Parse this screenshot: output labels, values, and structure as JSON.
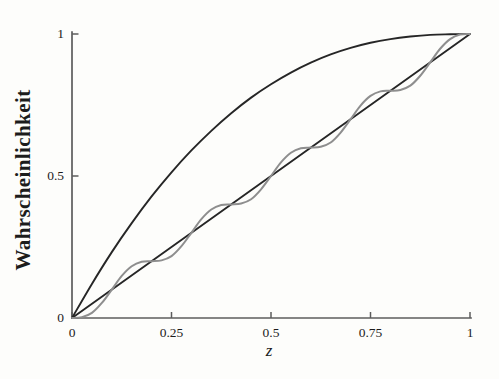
{
  "figure": {
    "background": "#fdfdfb",
    "axis_color": "#5c5c5c",
    "text_color": "#1c1c1c",
    "curve_black": "#262626",
    "curve_gray": "#8e8e8e"
  },
  "chart_data": {
    "type": "line",
    "title": "",
    "xlabel": "z",
    "ylabel": "Wahrscheinlichkeit",
    "xlim": [
      0,
      1
    ],
    "ylim": [
      0,
      1
    ],
    "grid": false,
    "legend": false,
    "x_ticks": [
      {
        "value": 0,
        "label": "0"
      },
      {
        "value": 0.25,
        "label": "0.25"
      },
      {
        "value": 0.5,
        "label": "0.5"
      },
      {
        "value": 0.75,
        "label": "0.75"
      },
      {
        "value": 1,
        "label": "1"
      }
    ],
    "y_ticks": [
      {
        "value": 0,
        "label": "0"
      },
      {
        "value": 0.5,
        "label": "0.5"
      },
      {
        "value": 1,
        "label": "1"
      }
    ],
    "series": [
      {
        "name": "upper-concave-curve",
        "color": "#262626",
        "width": 1.9,
        "x": [
          0,
          0.05,
          0.1,
          0.15,
          0.2,
          0.25,
          0.3,
          0.35,
          0.4,
          0.45,
          0.5,
          0.55,
          0.6,
          0.65,
          0.7,
          0.75,
          0.8,
          0.85,
          0.9,
          0.95,
          1
        ],
        "y": [
          0,
          0.12,
          0.232,
          0.334,
          0.428,
          0.513,
          0.59,
          0.659,
          0.721,
          0.776,
          0.823,
          0.864,
          0.899,
          0.928,
          0.951,
          0.969,
          0.982,
          0.991,
          0.997,
          0.999,
          1
        ]
      },
      {
        "name": "diagonal-line",
        "color": "#262626",
        "width": 1.9,
        "x": [
          0,
          1
        ],
        "y": [
          0,
          1
        ]
      },
      {
        "name": "oscillating-curve",
        "color": "#8e8e8e",
        "width": 2,
        "x": [
          0,
          0.025,
          0.05,
          0.075,
          0.1,
          0.125,
          0.15,
          0.175,
          0.2,
          0.225,
          0.25,
          0.275,
          0.3,
          0.325,
          0.35,
          0.375,
          0.4,
          0.425,
          0.45,
          0.475,
          0.5,
          0.525,
          0.55,
          0.575,
          0.6,
          0.625,
          0.65,
          0.675,
          0.7,
          0.725,
          0.75,
          0.775,
          0.8,
          0.825,
          0.85,
          0.875,
          0.9,
          0.925,
          0.95,
          0.975,
          1
        ],
        "y": [
          0,
          0.003,
          0.018,
          0.053,
          0.1,
          0.148,
          0.182,
          0.198,
          0.2,
          0.203,
          0.218,
          0.253,
          0.3,
          0.348,
          0.382,
          0.398,
          0.4,
          0.403,
          0.418,
          0.453,
          0.5,
          0.548,
          0.582,
          0.598,
          0.6,
          0.603,
          0.618,
          0.653,
          0.7,
          0.748,
          0.782,
          0.798,
          0.8,
          0.803,
          0.818,
          0.853,
          0.9,
          0.948,
          0.982,
          0.998,
          1
        ]
      }
    ]
  }
}
